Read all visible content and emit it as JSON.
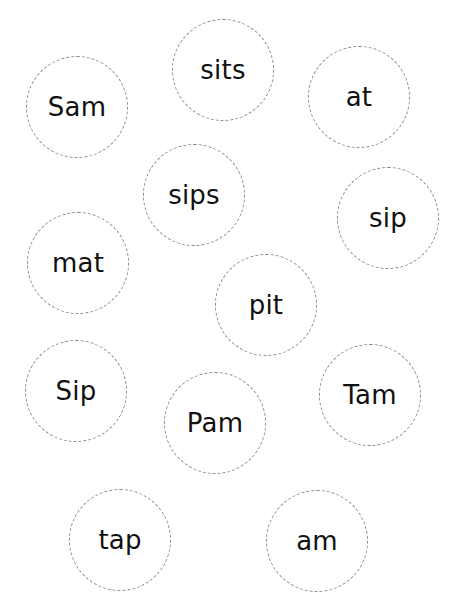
{
  "worksheet": {
    "circle_border_color": "#8a8a8a",
    "text_color": "#111111",
    "words": [
      {
        "text": "Sam",
        "cx": 77,
        "cy": 107,
        "r": 51
      },
      {
        "text": "sits",
        "cx": 223,
        "cy": 70,
        "r": 51
      },
      {
        "text": "at",
        "cx": 359,
        "cy": 97,
        "r": 51
      },
      {
        "text": "sips",
        "cx": 194,
        "cy": 195,
        "r": 51
      },
      {
        "text": "sip",
        "cx": 388,
        "cy": 218,
        "r": 51
      },
      {
        "text": "mat",
        "cx": 78,
        "cy": 263,
        "r": 51
      },
      {
        "text": "pit",
        "cx": 266,
        "cy": 305,
        "r": 51
      },
      {
        "text": "Sip",
        "cx": 76,
        "cy": 391,
        "r": 51
      },
      {
        "text": "Pam",
        "cx": 215,
        "cy": 423,
        "r": 51
      },
      {
        "text": "Tam",
        "cx": 370,
        "cy": 395,
        "r": 51
      },
      {
        "text": "tap",
        "cx": 120,
        "cy": 540,
        "r": 51
      },
      {
        "text": "am",
        "cx": 317,
        "cy": 541,
        "r": 51
      }
    ]
  }
}
